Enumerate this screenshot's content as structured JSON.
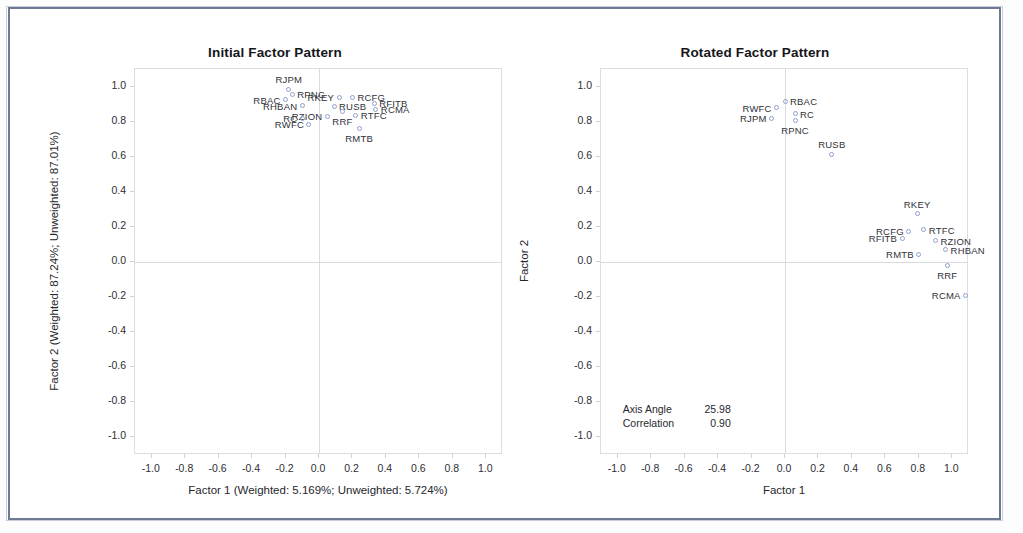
{
  "panels": [
    {
      "id": "initial",
      "title": "Initial Factor Pattern",
      "xlabel": "Factor 1 (Weighted: 5.169%; Unweighted: 5.724%)",
      "ylabel": "Factor 2 (Weighted: 87.24%; Unweighted: 87.01%)"
    },
    {
      "id": "rotated",
      "title": "Rotated Factor Pattern",
      "xlabel": "Factor 1",
      "ylabel": "Factor 2",
      "annotation": {
        "axis_angle_label": "Axis Angle",
        "axis_angle_value": "25.98",
        "correlation_label": "Correlation",
        "correlation_value": "0.90"
      }
    }
  ],
  "ticks": {
    "x": [
      "-1.0",
      "-0.8",
      "-0.6",
      "-0.4",
      "-0.2",
      "0.0",
      "0.2",
      "0.4",
      "0.6",
      "0.8",
      "1.0"
    ],
    "y": [
      "1.0",
      "0.8",
      "0.6",
      "0.4",
      "0.2",
      "0.0",
      "-0.2",
      "-0.4",
      "-0.6",
      "-0.8",
      "-1.0"
    ]
  },
  "chart_data": [
    {
      "type": "scatter",
      "title": "Initial Factor Pattern",
      "xlabel": "Factor 1 (Weighted: 5.169%; Unweighted: 5.724%)",
      "ylabel": "Factor 2 (Weighted: 87.24%; Unweighted: 87.01%)",
      "xlim": [
        -1.1,
        1.1
      ],
      "ylim": [
        -1.1,
        1.1
      ],
      "grid": false,
      "legend": "none",
      "points": [
        {
          "label": "RJPM",
          "x": -0.18,
          "y": 0.985,
          "pos": "above"
        },
        {
          "label": "RPNC",
          "x": -0.16,
          "y": 0.955,
          "pos": "right"
        },
        {
          "label": "RBAC",
          "x": -0.2,
          "y": 0.925,
          "pos": "left"
        },
        {
          "label": "RHBAN",
          "x": -0.1,
          "y": 0.89,
          "pos": "left"
        },
        {
          "label": "RUSB",
          "x": 0.09,
          "y": 0.888,
          "pos": "right"
        },
        {
          "label": "RKEY",
          "x": 0.12,
          "y": 0.94,
          "pos": "left"
        },
        {
          "label": "RCFG",
          "x": 0.2,
          "y": 0.94,
          "pos": "right"
        },
        {
          "label": "RFITB",
          "x": 0.33,
          "y": 0.905,
          "pos": "right"
        },
        {
          "label": "RCMA",
          "x": 0.34,
          "y": 0.87,
          "pos": "right"
        },
        {
          "label": "RRF",
          "x": 0.14,
          "y": 0.855,
          "pos": "below"
        },
        {
          "label": "RZION",
          "x": 0.05,
          "y": 0.83,
          "pos": "left"
        },
        {
          "label": "RTFC",
          "x": 0.22,
          "y": 0.835,
          "pos": "right"
        },
        {
          "label": "RC",
          "x": -0.1,
          "y": 0.82,
          "pos": "left"
        },
        {
          "label": "RWFC",
          "x": -0.06,
          "y": 0.785,
          "pos": "left"
        },
        {
          "label": "RMTB",
          "x": 0.24,
          "y": 0.76,
          "pos": "below"
        }
      ]
    },
    {
      "type": "scatter",
      "title": "Rotated Factor Pattern",
      "xlabel": "Factor 1",
      "ylabel": "Factor 2",
      "xlim": [
        -1.1,
        1.1
      ],
      "ylim": [
        -1.1,
        1.1
      ],
      "grid": false,
      "legend": "none",
      "annotations": [
        {
          "label": "Axis Angle",
          "value": "25.98"
        },
        {
          "label": "Correlation",
          "value": "0.90"
        }
      ],
      "points": [
        {
          "label": "RBAC",
          "x": 0.0,
          "y": 0.915,
          "pos": "right"
        },
        {
          "label": "RWFC",
          "x": -0.05,
          "y": 0.88,
          "pos": "left"
        },
        {
          "label": "RC",
          "x": 0.06,
          "y": 0.845,
          "pos": "right"
        },
        {
          "label": "RJPM",
          "x": -0.08,
          "y": 0.82,
          "pos": "left"
        },
        {
          "label": "RPNC",
          "x": 0.06,
          "y": 0.805,
          "pos": "below"
        },
        {
          "label": "RUSB",
          "x": 0.28,
          "y": 0.615,
          "pos": "above"
        },
        {
          "label": "RKEY",
          "x": 0.79,
          "y": 0.275,
          "pos": "above"
        },
        {
          "label": "RCFG",
          "x": 0.74,
          "y": 0.175,
          "pos": "left"
        },
        {
          "label": "RTFC",
          "x": 0.83,
          "y": 0.185,
          "pos": "right"
        },
        {
          "label": "RFITB",
          "x": 0.7,
          "y": 0.135,
          "pos": "left"
        },
        {
          "label": "RZION",
          "x": 0.9,
          "y": 0.12,
          "pos": "right"
        },
        {
          "label": "RHBAN",
          "x": 0.96,
          "y": 0.07,
          "pos": "right"
        },
        {
          "label": "RMTB",
          "x": 0.8,
          "y": 0.045,
          "pos": "left"
        },
        {
          "label": "RRF",
          "x": 0.97,
          "y": -0.02,
          "pos": "below"
        },
        {
          "label": "RCMA",
          "x": 1.08,
          "y": -0.19,
          "pos": "left"
        }
      ]
    }
  ]
}
